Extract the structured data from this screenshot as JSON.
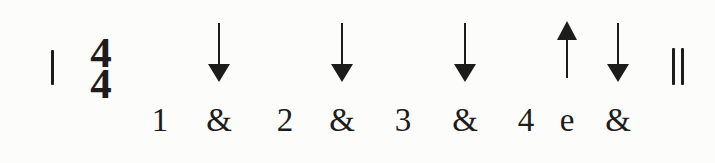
{
  "figure": {
    "colors": {
      "ink": "#1c1c1c",
      "background": "#fcfcfb"
    },
    "time_signature": {
      "top": "4",
      "bottom": "4"
    },
    "start_barline": "single",
    "end_barline": "double",
    "beats": [
      {
        "label": "1",
        "x": 160,
        "arrow": null
      },
      {
        "label": "&",
        "x": 219,
        "arrow": "down"
      },
      {
        "label": "2",
        "x": 285,
        "arrow": null
      },
      {
        "label": "&",
        "x": 342,
        "arrow": "down"
      },
      {
        "label": "3",
        "x": 403,
        "arrow": null
      },
      {
        "label": "&",
        "x": 465,
        "arrow": "down"
      },
      {
        "label": "4",
        "x": 526,
        "arrow": null
      },
      {
        "label": "e",
        "x": 567,
        "arrow": "up"
      },
      {
        "label": "&",
        "x": 618,
        "arrow": "down"
      }
    ]
  }
}
